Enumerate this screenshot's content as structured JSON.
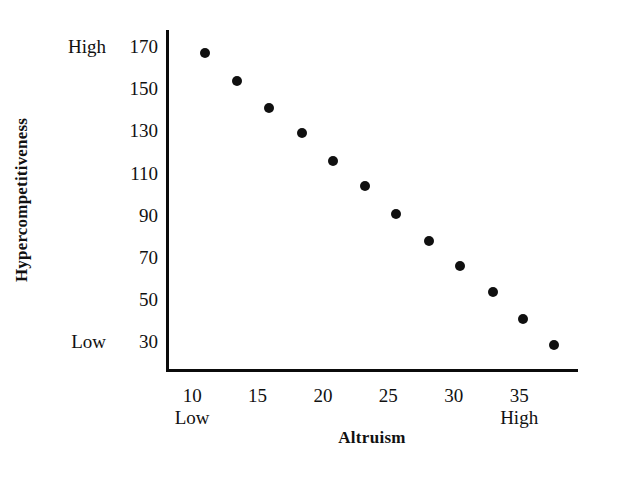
{
  "chart_data": {
    "type": "scatter",
    "title": "",
    "xlabel": "Altruism",
    "ylabel": "Hypercompetitiveness",
    "xlim": [
      8.0,
      39.5
    ],
    "ylim": [
      16,
      178
    ],
    "grid": false,
    "legend": null,
    "xticks": [
      10,
      15,
      20,
      25,
      30,
      35
    ],
    "xticklabels": [
      "10",
      "15",
      "20",
      "25",
      "30",
      "35"
    ],
    "yticks": [
      30,
      50,
      70,
      90,
      110,
      130,
      150,
      170
    ],
    "yticklabels": [
      "30",
      "50",
      "70",
      "90",
      "110",
      "130",
      "150",
      "170"
    ],
    "x_anchor_labels": [
      {
        "text": "Low",
        "at": 10
      },
      {
        "text": "High",
        "at": 35
      }
    ],
    "y_anchor_labels": [
      {
        "text": "High",
        "at": 170
      },
      {
        "text": "Low",
        "at": 30
      }
    ],
    "marker": {
      "shape": "circle",
      "color": "#101010",
      "size": 10
    },
    "points": [
      {
        "x": 11.0,
        "y": 167
      },
      {
        "x": 13.4,
        "y": 154
      },
      {
        "x": 15.9,
        "y": 141
      },
      {
        "x": 18.4,
        "y": 129
      },
      {
        "x": 20.8,
        "y": 116
      },
      {
        "x": 23.2,
        "y": 104
      },
      {
        "x": 25.6,
        "y": 91
      },
      {
        "x": 28.1,
        "y": 78
      },
      {
        "x": 30.5,
        "y": 66
      },
      {
        "x": 33.0,
        "y": 54
      },
      {
        "x": 35.3,
        "y": 41
      },
      {
        "x": 37.7,
        "y": 29
      }
    ],
    "axis_color": "#0b0b0b",
    "background": "#ffffff"
  }
}
